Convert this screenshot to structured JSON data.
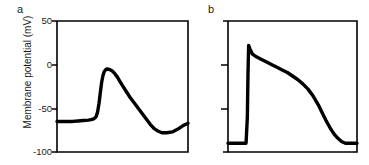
{
  "figure": {
    "width": 369,
    "height": 165,
    "background": "#ffffff",
    "trace_color": "#000000",
    "axis_color": "#000000",
    "text_color": "#1a1a1a"
  },
  "axis_title": "Membrane potential (mV)",
  "panels": [
    {
      "letter": "a",
      "name": "neuronal-action-potential",
      "frame": {
        "x": 57,
        "y": 21,
        "width": 131,
        "height": 131
      },
      "ticks_labeled": true,
      "tick_labels": [
        "50",
        "0",
        "-50",
        "-100"
      ]
    },
    {
      "letter": "b",
      "name": "cardiac-action-potential",
      "frame": {
        "x": 228,
        "y": 21,
        "width": 129,
        "height": 131
      },
      "ticks_labeled": false,
      "tick_labels": [
        "",
        "",
        "",
        ""
      ]
    }
  ],
  "chart_data": [
    {
      "type": "line",
      "name": "panel-a-neuronal-action-potential",
      "title": "a",
      "xlabel": "",
      "ylabel": "Membrane potential (mV)",
      "ylim": [
        -100,
        50
      ],
      "yticks": [
        50,
        0,
        -50,
        -100
      ],
      "ytick_labels": [
        "50",
        "0",
        "-50",
        "-100"
      ],
      "xlim": [
        0,
        100
      ],
      "grid": false,
      "legend": false,
      "x": [
        0,
        4,
        8,
        12,
        16,
        20,
        24,
        26,
        28,
        29,
        30,
        31,
        32,
        33,
        34,
        35,
        36,
        37,
        38,
        40,
        42,
        44,
        46,
        48,
        50,
        53,
        56,
        59,
        62,
        65,
        68,
        71,
        74,
        77,
        80,
        84,
        88,
        92,
        96,
        100
      ],
      "y": [
        -65,
        -65,
        -65,
        -65,
        -64.5,
        -64,
        -63.5,
        -63,
        -62,
        -61,
        -59,
        -54,
        -45,
        -33,
        -21,
        -13,
        -8,
        -6,
        -5,
        -5.5,
        -7,
        -10,
        -14,
        -19,
        -24,
        -31,
        -38,
        -44,
        -50,
        -56,
        -62,
        -68,
        -73,
        -76,
        -78,
        -78,
        -77,
        -74,
        -70,
        -67
      ]
    },
    {
      "type": "line",
      "name": "panel-b-cardiac-action-potential",
      "title": "b",
      "xlabel": "",
      "ylabel": "Membrane potential (mV)",
      "ylim": [
        -100,
        50
      ],
      "yticks": [
        50,
        0,
        -50,
        -100
      ],
      "ytick_labels": [
        "",
        "",
        "",
        ""
      ],
      "xlim": [
        0,
        100
      ],
      "grid": false,
      "legend": false,
      "x": [
        0,
        5,
        10,
        14,
        15,
        15.5,
        16,
        17,
        19,
        22,
        26,
        30,
        34,
        38,
        42,
        46,
        50,
        54,
        58,
        62,
        66,
        70,
        73,
        76,
        79,
        82,
        85,
        88,
        91,
        94,
        97,
        100
      ],
      "y": [
        -90,
        -90,
        -90,
        -90,
        -60,
        -10,
        22,
        18,
        12,
        9,
        6,
        3,
        0,
        -3,
        -6,
        -9,
        -13,
        -17,
        -22,
        -28,
        -36,
        -46,
        -55,
        -64,
        -72,
        -79,
        -84,
        -88,
        -90,
        -90,
        -90,
        -90
      ]
    }
  ]
}
